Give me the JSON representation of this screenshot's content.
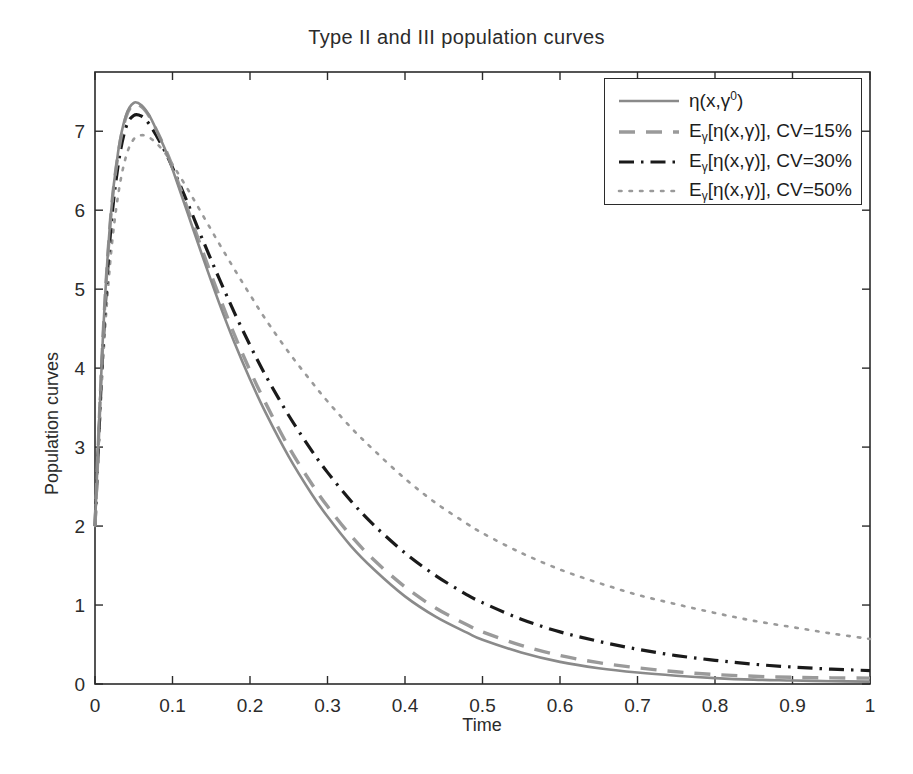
{
  "figure": {
    "title": "Type II and III population curves",
    "background_color": "#ffffff",
    "width": 913,
    "height": 774
  },
  "axes": {
    "xlabel": "Time",
    "ylabel": "Population curves",
    "x_ticks": [
      "0",
      "0.1",
      "0.2",
      "0.3",
      "0.4",
      "0.5",
      "0.6",
      "0.7",
      "0.8",
      "0.9",
      "1"
    ],
    "y_ticks": [
      "0",
      "1",
      "2",
      "3",
      "4",
      "5",
      "6",
      "7"
    ],
    "xlim": [
      0,
      1
    ],
    "ylim": [
      0,
      7.75
    ],
    "grid": false,
    "box": true
  },
  "legend": {
    "position": "upper-right",
    "border_color": "#2b2b2b",
    "entries": [
      {
        "id": "eta-true",
        "label_html": "&#951;(x,&#947;<sup>0</sup>)",
        "label_plain": "eta(x,gamma^0)",
        "style": "solid",
        "color": "#8a8a8a"
      },
      {
        "id": "cv-15",
        "label_html": "E<sub>&#947;</sub>[&#951;(x,&#947;)], CV=15%",
        "label_plain": "E_gamma[eta(x,gamma)], CV=15%",
        "style": "dashed",
        "color": "#9a9a9a"
      },
      {
        "id": "cv-30",
        "label_html": "E<sub>&#947;</sub>[&#951;(x,&#947;)], CV=30%",
        "label_plain": "E_gamma[eta(x,gamma)], CV=30%",
        "style": "dashdot",
        "color": "#1a1a1a"
      },
      {
        "id": "cv-50",
        "label_html": "E<sub>&#947;</sub>[&#951;(x,&#947;)], CV=50%",
        "label_plain": "E_gamma[eta(x,gamma)], CV=50%",
        "style": "dotted",
        "color": "#9a9a9a"
      }
    ]
  },
  "chart_data": {
    "type": "line",
    "title": "Type II and III population curves",
    "xlabel": "Time",
    "ylabel": "Population curves",
    "xlim": [
      0,
      1
    ],
    "ylim": [
      0,
      7.75
    ],
    "grid": false,
    "legend_position": "upper-right",
    "x": [
      0,
      0.01,
      0.02,
      0.03,
      0.04,
      0.05,
      0.06,
      0.07,
      0.08,
      0.09,
      0.1,
      0.12,
      0.14,
      0.16,
      0.18,
      0.2,
      0.22,
      0.25,
      0.28,
      0.3,
      0.33,
      0.36,
      0.4,
      0.44,
      0.48,
      0.5,
      0.55,
      0.6,
      0.65,
      0.7,
      0.75,
      0.8,
      0.85,
      0.9,
      0.95,
      1.0
    ],
    "series": [
      {
        "name": "eta(x,gamma^0)",
        "style": "solid",
        "color": "#8a8a8a",
        "values": [
          2.0,
          4.35,
          5.9,
          6.75,
          7.2,
          7.36,
          7.33,
          7.2,
          7.0,
          6.78,
          6.52,
          5.95,
          5.38,
          4.83,
          4.32,
          3.86,
          3.44,
          2.88,
          2.4,
          2.12,
          1.75,
          1.45,
          1.11,
          0.85,
          0.65,
          0.56,
          0.4,
          0.28,
          0.2,
          0.145,
          0.105,
          0.075,
          0.055,
          0.045,
          0.035,
          0.03
        ]
      },
      {
        "name": "E_gamma[eta(x,gamma)], CV=15%",
        "style": "dashed",
        "color": "#9a9a9a",
        "values": [
          2.0,
          4.33,
          5.88,
          6.72,
          7.18,
          7.34,
          7.31,
          7.19,
          7.0,
          6.79,
          6.55,
          6.0,
          5.45,
          4.92,
          4.42,
          3.97,
          3.56,
          3.0,
          2.53,
          2.25,
          1.88,
          1.57,
          1.23,
          0.96,
          0.75,
          0.66,
          0.49,
          0.36,
          0.27,
          0.205,
          0.155,
          0.12,
          0.098,
          0.085,
          0.078,
          0.075
        ]
      },
      {
        "name": "E_gamma[eta(x,gamma)], CV=30%",
        "style": "dashdot",
        "color": "#1a1a1a",
        "values": [
          2.0,
          4.22,
          5.72,
          6.58,
          7.05,
          7.2,
          7.19,
          7.09,
          6.93,
          6.75,
          6.54,
          6.08,
          5.6,
          5.14,
          4.7,
          4.29,
          3.91,
          3.4,
          2.95,
          2.68,
          2.32,
          2.01,
          1.66,
          1.37,
          1.13,
          1.03,
          0.82,
          0.66,
          0.54,
          0.44,
          0.36,
          0.3,
          0.25,
          0.215,
          0.188,
          0.17
        ]
      },
      {
        "name": "E_gamma[eta(x,gamma)], CV=50%",
        "style": "dotted",
        "color": "#9a9a9a",
        "values": [
          2.0,
          4.02,
          5.38,
          6.2,
          6.68,
          6.9,
          6.95,
          6.92,
          6.84,
          6.73,
          6.58,
          6.26,
          5.92,
          5.58,
          5.25,
          4.93,
          4.62,
          4.2,
          3.82,
          3.58,
          3.25,
          2.96,
          2.6,
          2.29,
          2.03,
          1.91,
          1.66,
          1.45,
          1.28,
          1.13,
          1.01,
          0.9,
          0.8,
          0.72,
          0.64,
          0.57
        ]
      }
    ]
  }
}
